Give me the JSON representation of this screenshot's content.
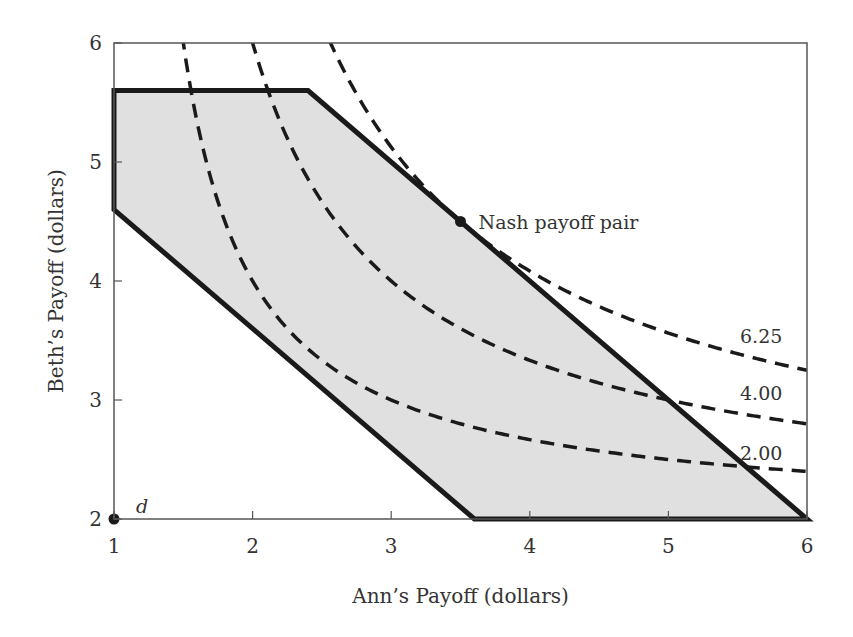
{
  "chart_data": {
    "type": "line",
    "title": "",
    "xlabel": "Ann’s Payoff (dollars)",
    "ylabel": "Beth’s Payoff (dollars)",
    "xlim": [
      1,
      6
    ],
    "ylim": [
      2,
      6
    ],
    "xticks": [
      1,
      2,
      3,
      4,
      5,
      6
    ],
    "yticks": [
      2,
      3,
      4,
      5,
      6
    ],
    "xtick_labels": [
      "1",
      "2",
      "3",
      "4",
      "5",
      "6"
    ],
    "ytick_labels": [
      "2",
      "3",
      "4",
      "5",
      "6"
    ],
    "grid": false,
    "legend": null,
    "feasible_region": {
      "vertices": [
        [
          1,
          5.6
        ],
        [
          2.4,
          5.6
        ],
        [
          6,
          2
        ],
        [
          3.6,
          2
        ],
        [
          1,
          4.6
        ]
      ],
      "fill": "#e0e0e0",
      "stroke": "#1a1a1a"
    },
    "series": [
      {
        "name": "2.00",
        "style": "dashed",
        "formula": "(x-1)(y-2)=2.00",
        "x_range": [
          1.5,
          6
        ],
        "end_label": "2.00"
      },
      {
        "name": "4.00",
        "style": "dashed",
        "formula": "(x-1)(y-2)=4.00",
        "x_range": [
          2.0,
          6
        ],
        "end_label": "4.00"
      },
      {
        "name": "6.25",
        "style": "dashed",
        "formula": "(x-1)(y-2)=6.25",
        "x_range": [
          2.6,
          6
        ],
        "end_label": "6.25"
      }
    ],
    "points": [
      {
        "name": "d",
        "x": 1,
        "y": 2,
        "label": "d"
      },
      {
        "name": "Nash payoff pair",
        "x": 3.5,
        "y": 4.5,
        "label": "Nash payoff pair"
      }
    ],
    "annotations": [
      {
        "text": "6.25",
        "x": 5.6,
        "y": 3.48
      },
      {
        "text": "4.00",
        "x": 5.6,
        "y": 3.0
      },
      {
        "text": "2.00",
        "x": 5.6,
        "y": 2.5
      }
    ]
  }
}
